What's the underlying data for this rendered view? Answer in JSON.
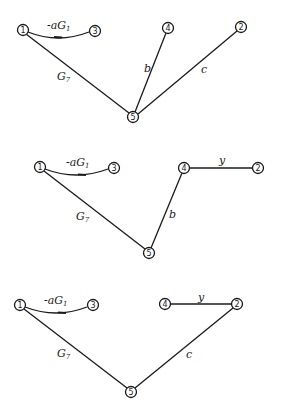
{
  "diagrams": [
    {
      "nodes": [
        {
          "id": "1",
          "label": "1",
          "x": 23,
          "y": 30
        },
        {
          "id": "3",
          "label": "3",
          "x": 95,
          "y": 31
        },
        {
          "id": "4",
          "label": "4",
          "x": 168,
          "y": 28
        },
        {
          "id": "2",
          "label": "2",
          "x": 241,
          "y": 27
        },
        {
          "id": "5",
          "label": "5",
          "x": 133,
          "y": 117
        }
      ],
      "edges": [
        {
          "from": "1",
          "to": "3",
          "label": "-aG",
          "sub": "1",
          "curved": true,
          "arrow": true
        },
        {
          "from": "1",
          "to": "5",
          "label": "G",
          "sub": "7"
        },
        {
          "from": "4",
          "to": "5",
          "label": "b"
        },
        {
          "from": "2",
          "to": "5",
          "label": "c"
        }
      ]
    },
    {
      "nodes": [
        {
          "id": "1",
          "label": "1",
          "x": 40,
          "y": 167
        },
        {
          "id": "3",
          "label": "3",
          "x": 114,
          "y": 168
        },
        {
          "id": "4",
          "label": "4",
          "x": 184,
          "y": 168
        },
        {
          "id": "2",
          "label": "2",
          "x": 258,
          "y": 168
        },
        {
          "id": "5",
          "label": "5",
          "x": 149,
          "y": 253
        }
      ],
      "edges": [
        {
          "from": "1",
          "to": "3",
          "label": "-aG",
          "sub": "1",
          "curved": true,
          "arrow": true
        },
        {
          "from": "1",
          "to": "5",
          "label": "G",
          "sub": "7"
        },
        {
          "from": "4",
          "to": "5",
          "label": "b"
        },
        {
          "from": "4",
          "to": "2",
          "label": "y"
        }
      ]
    },
    {
      "nodes": [
        {
          "id": "1",
          "label": "1",
          "x": 20,
          "y": 305
        },
        {
          "id": "3",
          "label": "3",
          "x": 93,
          "y": 305
        },
        {
          "id": "4",
          "label": "4",
          "x": 165,
          "y": 304
        },
        {
          "id": "2",
          "label": "2",
          "x": 237,
          "y": 304
        },
        {
          "id": "5",
          "label": "5",
          "x": 131,
          "y": 392
        }
      ],
      "edges": [
        {
          "from": "1",
          "to": "3",
          "label": "-aG",
          "sub": "1",
          "curved": true,
          "arrow": true
        },
        {
          "from": "1",
          "to": "5",
          "label": "G",
          "sub": "7"
        },
        {
          "from": "4",
          "to": "2",
          "label": "y"
        },
        {
          "from": "2",
          "to": "5",
          "label": "c"
        }
      ]
    }
  ],
  "labels": {
    "neg_a_G": "-aG",
    "sub1": "1",
    "G": "G",
    "sub7": "7",
    "b": "b",
    "c": "c",
    "y": "y",
    "n1": "1",
    "n2": "2",
    "n3": "3",
    "n4": "4",
    "n5": "5"
  }
}
